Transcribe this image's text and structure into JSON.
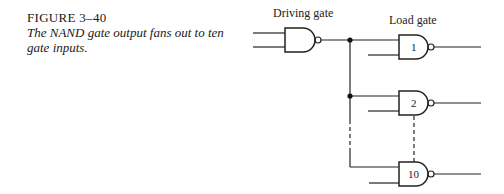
{
  "caption": {
    "figure_number": "FIGURE 3–40",
    "text": "The NAND gate output fans out to ten gate inputs."
  },
  "diagram": {
    "driving_label": "Driving gate",
    "load_label": "Load gate",
    "gates": [
      {
        "id": "driving",
        "label": ""
      },
      {
        "id": "load-1",
        "label": "1"
      },
      {
        "id": "load-2",
        "label": "2"
      },
      {
        "id": "load-10",
        "label": "10"
      }
    ],
    "line_color": "#222222"
  }
}
